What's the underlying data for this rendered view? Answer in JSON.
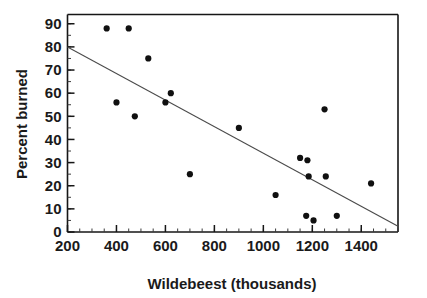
{
  "chart_data": {
    "type": "scatter",
    "title": "",
    "xlabel": "Wildebeest (thousands)",
    "ylabel": "Percent burned",
    "xlim": [
      200,
      1550
    ],
    "ylim": [
      0,
      94
    ],
    "xticks": [
      200,
      400,
      600,
      800,
      1000,
      1200,
      1400
    ],
    "yticks": [
      0,
      10,
      20,
      30,
      40,
      50,
      60,
      70,
      80,
      90
    ],
    "xtick_labels": [
      "200",
      "400",
      "600",
      "800",
      "1000",
      "1200",
      "1400"
    ],
    "ytick_labels": [
      "0",
      "10",
      "20",
      "30",
      "40",
      "50",
      "60",
      "70",
      "80",
      "90"
    ],
    "x_minor_step": 50,
    "y_minor_step": 5,
    "grid": false,
    "legend": null,
    "points": [
      {
        "x": 360,
        "y": 88
      },
      {
        "x": 450,
        "y": 88
      },
      {
        "x": 530,
        "y": 75
      },
      {
        "x": 400,
        "y": 56
      },
      {
        "x": 475,
        "y": 50
      },
      {
        "x": 600,
        "y": 56
      },
      {
        "x": 622,
        "y": 60
      },
      {
        "x": 700,
        "y": 25
      },
      {
        "x": 900,
        "y": 45
      },
      {
        "x": 1050,
        "y": 16
      },
      {
        "x": 1150,
        "y": 32
      },
      {
        "x": 1180,
        "y": 31
      },
      {
        "x": 1185,
        "y": 24
      },
      {
        "x": 1175,
        "y": 7
      },
      {
        "x": 1205,
        "y": 5
      },
      {
        "x": 1250,
        "y": 53
      },
      {
        "x": 1255,
        "y": 24
      },
      {
        "x": 1300,
        "y": 7
      },
      {
        "x": 1440,
        "y": 21
      }
    ],
    "trend_line": {
      "type": "linear-fit",
      "x_start": 200,
      "y_start": 80,
      "x_end": 1550,
      "y_end": 2.5,
      "style": "thin-solid"
    }
  }
}
